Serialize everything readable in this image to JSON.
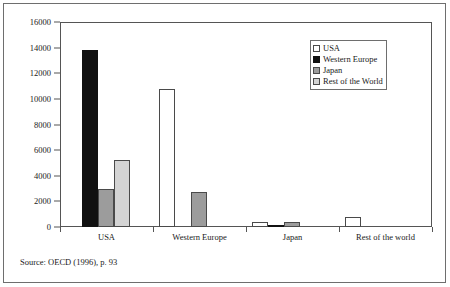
{
  "figure": {
    "source_note": "Source: OECD (1996), p. 93"
  },
  "legend": {
    "position": "top-right",
    "items": [
      {
        "label": "USA",
        "swatch": "white-square-icon",
        "color": "#ffffff"
      },
      {
        "label": "Western Europe",
        "swatch": "black-square-icon",
        "color": "#111111"
      },
      {
        "label": "Japan",
        "swatch": "gray-square-icon",
        "color": "#9c9c9c"
      },
      {
        "label": "Rest of the World",
        "swatch": "light-gray-square-icon",
        "color": "#d4d4d4"
      }
    ]
  },
  "chart_data": {
    "type": "bar",
    "title": "",
    "subtitle": "",
    "xlabel": "",
    "ylabel": "",
    "ylim": [
      0,
      16000
    ],
    "ytick_step": 2000,
    "yticks": [
      0,
      2000,
      4000,
      6000,
      8000,
      10000,
      12000,
      14000,
      16000
    ],
    "ytick_labels": [
      "0",
      "2000",
      "4000",
      "6000",
      "8000",
      "10000",
      "12000",
      "14000",
      "16000"
    ],
    "grid": false,
    "categories": [
      "USA",
      "Western Europe",
      "Japan",
      "Rest of the world"
    ],
    "series": [
      {
        "name": "USA",
        "color": "#ffffff",
        "values": [
          0,
          10800,
          400,
          800
        ]
      },
      {
        "name": "Western Europe",
        "color": "#111111",
        "values": [
          13800,
          0,
          100,
          0
        ]
      },
      {
        "name": "Japan",
        "color": "#9c9c9c",
        "values": [
          3000,
          2700,
          400,
          0
        ]
      },
      {
        "name": "Rest of the World",
        "color": "#d4d4d4",
        "values": [
          5200,
          0,
          0,
          0
        ]
      }
    ],
    "annotations": []
  }
}
